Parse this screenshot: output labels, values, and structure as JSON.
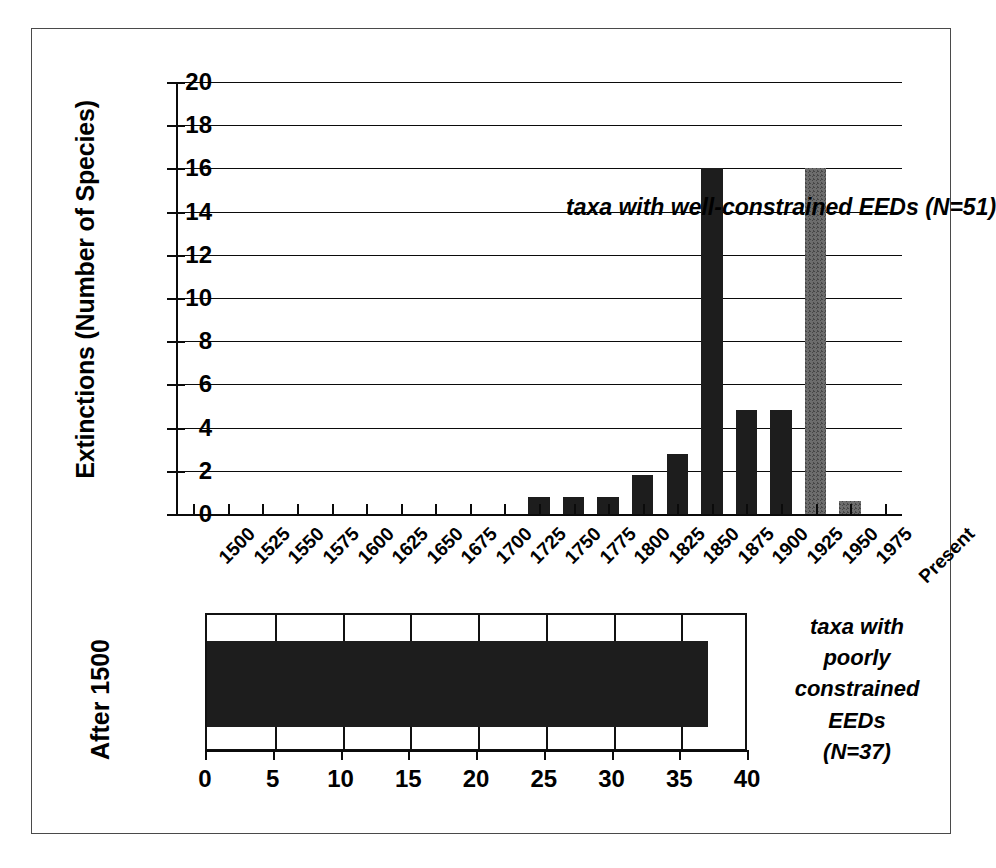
{
  "chart_data": [
    {
      "type": "bar",
      "id": "well-constrained-histogram",
      "title": "",
      "annotation": "taxa with well-constrained EEDs (N=51)",
      "xlabel": "",
      "ylabel": "Extinctions (Number of Species)",
      "ylim": [
        0,
        20
      ],
      "ytick_labels": [
        "0",
        "2",
        "4",
        "6",
        "8",
        "10",
        "12",
        "14",
        "16",
        "18",
        "20"
      ],
      "ytick_values": [
        0,
        2,
        4,
        6,
        8,
        10,
        12,
        14,
        16,
        18,
        20
      ],
      "grid": true,
      "legend": "none",
      "categories": [
        "1500",
        "1525",
        "1550",
        "1575",
        "1600",
        "1625",
        "1650",
        "1675",
        "1700",
        "1725",
        "1750",
        "1775",
        "1800",
        "1825",
        "1850",
        "1875",
        "1900",
        "1925",
        "1950",
        "1975",
        "Present"
      ],
      "values": [
        0,
        0,
        0,
        0,
        0,
        0,
        0,
        0,
        0,
        0,
        0.8,
        0.8,
        0.8,
        1.8,
        2.8,
        16,
        4.8,
        4.8,
        16,
        0.6,
        0
      ],
      "bar_styles": [
        "dark",
        "dark",
        "dark",
        "dark",
        "dark",
        "dark",
        "dark",
        "dark",
        "dark",
        "dark",
        "dark",
        "dark",
        "dark",
        "dark",
        "dark",
        "dark",
        "dark",
        "dark",
        "gray",
        "gray",
        "dark"
      ],
      "colors": {
        "dark": "#1d1d1d",
        "gray": "#6d6d6d"
      }
    },
    {
      "type": "bar",
      "id": "poorly-constrained-bar",
      "orientation": "horizontal",
      "title": "",
      "annotation_lines": [
        "taxa with",
        "poorly",
        "constrained",
        "EEDs",
        "(N=37)"
      ],
      "xlabel": "",
      "ylabel": "After 1500",
      "xlim": [
        0,
        40
      ],
      "xtick_labels": [
        "0",
        "5",
        "10",
        "15",
        "20",
        "25",
        "30",
        "35",
        "40"
      ],
      "xtick_values": [
        0,
        5,
        10,
        15,
        20,
        25,
        30,
        35,
        40
      ],
      "grid": true,
      "categories": [
        "After 1500"
      ],
      "values": [
        37
      ],
      "colors": {
        "bar": "#1d1d1d"
      }
    }
  ],
  "top_chart": {
    "y_axis_title": "Extinctions (Number of Species)",
    "annotation": "taxa with well-constrained EEDs (N=51)"
  },
  "bottom_chart": {
    "y_axis_title": "After 1500",
    "annotation_lines": [
      "taxa with",
      "poorly",
      "constrained",
      "EEDs",
      "(N=37)"
    ]
  }
}
